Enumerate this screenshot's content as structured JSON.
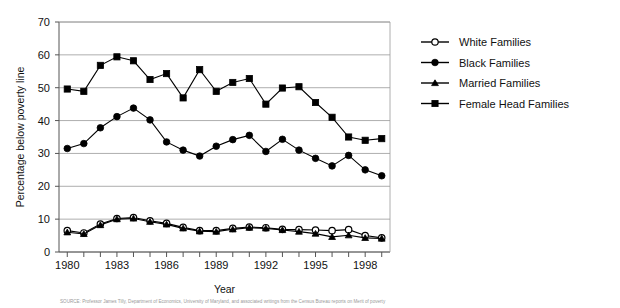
{
  "chart_data": {
    "type": "line",
    "title": "",
    "xlabel": "Year",
    "ylabel": "Percentage below poverty line",
    "xlim": [
      1979.5,
      1999.5
    ],
    "ylim": [
      0,
      70
    ],
    "ytick_step": 10,
    "yticks": [
      0,
      10,
      20,
      30,
      40,
      50,
      60,
      70
    ],
    "grid": "horizontal",
    "legend_position": "right",
    "x": [
      1980,
      1981,
      1982,
      1983,
      1984,
      1985,
      1986,
      1987,
      1988,
      1989,
      1990,
      1991,
      1992,
      1993,
      1994,
      1995,
      1996,
      1997,
      1998,
      1999
    ],
    "xtick_labels": [
      "1980",
      "",
      "",
      "1983",
      "",
      "",
      "1986",
      "",
      "",
      "1989",
      "",
      "",
      "1992",
      "",
      "",
      "1995",
      "",
      "",
      "1998",
      ""
    ],
    "xtick_labels_shown": [
      "1980",
      "1983",
      "1986",
      "1989",
      "1992",
      "1995",
      "1998"
    ],
    "series": [
      {
        "name": "White Families",
        "marker": "open-circle",
        "values": [
          6.5,
          5.8,
          8.5,
          10.2,
          10.5,
          9.5,
          8.7,
          7.5,
          6.5,
          6.5,
          7.2,
          7.6,
          7.4,
          6.9,
          6.8,
          6.7,
          6.5,
          6.8,
          5.0,
          4.3
        ]
      },
      {
        "name": "Black Families",
        "marker": "filled-circle",
        "values": [
          31.5,
          33.0,
          37.8,
          41.2,
          43.8,
          40.2,
          33.5,
          31.0,
          29.2,
          32.2,
          34.2,
          35.5,
          30.6,
          34.3,
          31.0,
          28.5,
          26.2,
          29.4,
          25.0,
          23.2
        ]
      },
      {
        "name": "Married Families",
        "marker": "triangle",
        "values": [
          6.0,
          5.5,
          8.2,
          10.0,
          10.2,
          9.2,
          8.4,
          7.2,
          6.3,
          6.2,
          6.9,
          7.4,
          7.2,
          6.7,
          6.2,
          5.6,
          4.6,
          5.1,
          4.3,
          4.1
        ]
      },
      {
        "name": "Female Head Families",
        "marker": "filled-square",
        "values": [
          49.6,
          48.9,
          56.8,
          59.4,
          58.2,
          52.5,
          54.3,
          46.9,
          55.5,
          48.9,
          51.6,
          52.8,
          45.0,
          49.9,
          50.3,
          45.5,
          41.0,
          35.0,
          34.0,
          34.5
        ]
      }
    ]
  },
  "legend": {
    "items": [
      {
        "label": "White Families",
        "marker": "open-circle"
      },
      {
        "label": "Black Families",
        "marker": "filled-circle"
      },
      {
        "label": "Married Families",
        "marker": "triangle"
      },
      {
        "label": "Female Head Families",
        "marker": "filled-square"
      }
    ]
  },
  "caption": {
    "text": "SOURCE: Professor James Tilly, Department of Economics, University of Maryland, and associated writings from the Census Bureau reports on Merit of poverty"
  },
  "colors": {
    "ink": "#000000",
    "grid": "#999999",
    "axis": "#555555",
    "background": "#ffffff"
  }
}
